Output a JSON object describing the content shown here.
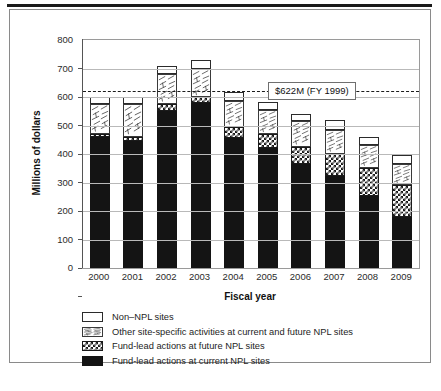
{
  "chart_data": {
    "type": "bar",
    "stacked": true,
    "title": "",
    "xlabel": "Fiscal year",
    "ylabel": "Millions of dollars",
    "ylim": [
      0,
      800
    ],
    "ytick_step": 100,
    "yticks": [
      "800",
      "700",
      "600",
      "500",
      "400",
      "300",
      "200",
      "100",
      "0"
    ],
    "grid": true,
    "legend_position": "below",
    "categories": [
      "2000",
      "2001",
      "2002",
      "2003",
      "2004",
      "2005",
      "2006",
      "2007",
      "2008",
      "2009"
    ],
    "series": [
      {
        "name": "Fund-lead actions at current NPL sites",
        "pattern": "solid-black",
        "color": "#141414",
        "values": [
          460,
          447,
          550,
          578,
          455,
          420,
          365,
          323,
          253,
          180
        ]
      },
      {
        "name": "Fund-lead actions at future NPL sites",
        "pattern": "checkerboard",
        "color": "#1a1a1a",
        "values": [
          10,
          13,
          25,
          22,
          40,
          50,
          60,
          78,
          98,
          110
        ]
      },
      {
        "name": "Other site-specific activities at current and future NPL sites",
        "pattern": "hatch",
        "color": "#3a3a3a",
        "values": [
          105,
          115,
          105,
          100,
          90,
          85,
          90,
          83,
          80,
          75
        ]
      },
      {
        "name": "Non–NPL sites",
        "pattern": "white",
        "color": "#ffffff",
        "values": [
          25,
          25,
          30,
          30,
          32,
          28,
          27,
          34,
          30,
          30
        ]
      }
    ],
    "totals": [
      600,
      600,
      710,
      730,
      617,
      583,
      542,
      518,
      461,
      395
    ],
    "annotations": [
      {
        "type": "horizontal-reference-line",
        "label": "$622M (FY 1999)",
        "value": 622,
        "style": "dashed"
      }
    ]
  },
  "legend": {
    "items": [
      {
        "label": "Non–NPL sites",
        "pattern": "white"
      },
      {
        "label": "Other site-specific activities at current and future NPL sites",
        "pattern": "hatch"
      },
      {
        "label": "Fund-lead actions at future NPL sites",
        "pattern": "checkerboard"
      },
      {
        "label": "Fund-lead actions at current NPL sites",
        "pattern": "solid-black"
      }
    ]
  },
  "axis": {
    "y_title": "Millions of dollars",
    "x_title": "Fiscal year"
  }
}
